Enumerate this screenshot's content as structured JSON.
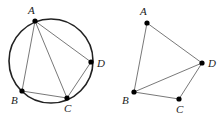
{
  "figures": [
    {
      "name": "cyclic-quadrilateral",
      "circle": {
        "cx": 51,
        "cy": 61,
        "r": 42
      },
      "points": [
        {
          "label": "A",
          "x": 35,
          "y": 21,
          "lx": 28,
          "ly": 14
        },
        {
          "label": "B",
          "x": 22,
          "y": 91,
          "lx": 11,
          "ly": 104
        },
        {
          "label": "C",
          "x": 67,
          "y": 98,
          "lx": 64,
          "ly": 112
        },
        {
          "label": "D",
          "x": 91,
          "y": 62,
          "lx": 97,
          "ly": 67
        }
      ],
      "edges": [
        [
          "A",
          "B"
        ],
        [
          "B",
          "C"
        ],
        [
          "C",
          "D"
        ],
        [
          "D",
          "A"
        ],
        [
          "A",
          "C"
        ]
      ]
    },
    {
      "name": "quadrilateral",
      "points": [
        {
          "label": "A",
          "x": 147,
          "y": 23,
          "lx": 140,
          "ly": 15
        },
        {
          "label": "B",
          "x": 134,
          "y": 92,
          "lx": 122,
          "ly": 104
        },
        {
          "label": "C",
          "x": 179,
          "y": 99,
          "lx": 176,
          "ly": 113
        },
        {
          "label": "D",
          "x": 202,
          "y": 63,
          "lx": 208,
          "ly": 67
        }
      ],
      "edges": [
        [
          "A",
          "B"
        ],
        [
          "B",
          "C"
        ],
        [
          "C",
          "D"
        ],
        [
          "D",
          "A"
        ],
        [
          "B",
          "D"
        ]
      ]
    }
  ]
}
